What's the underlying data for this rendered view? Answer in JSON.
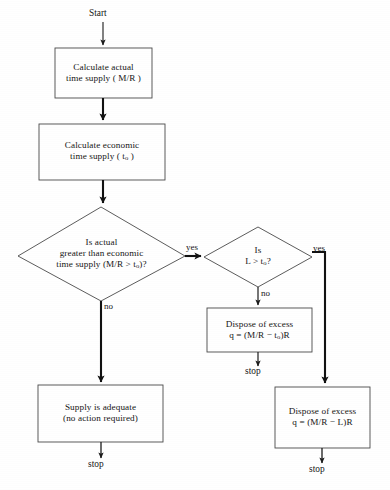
{
  "diagram": {
    "type": "flowchart",
    "background_color": "#ffffff",
    "line_color": "#1b1b1b",
    "text_color": "#161616"
  },
  "terminals": {
    "start": "Start",
    "stop_left": "stop",
    "stop_middle": "stop",
    "stop_right": "stop"
  },
  "process_boxes": [
    {
      "id": "calc-actual",
      "line1": "Calculate actual",
      "line2_prefix": "time supply ( M/R )",
      "line2": "time supply ( M/R )"
    },
    {
      "id": "calc-economic",
      "line1": "Calculate economic",
      "line2_prefix": "time supply ( t",
      "line2_sub": "o",
      "line2_suffix": " )"
    },
    {
      "id": "dispose-excess-t0",
      "line1": "Dispose of excess",
      "line2_prefix": "q = (M/R − t",
      "line2_sub": "o",
      "line2_suffix": ")R"
    },
    {
      "id": "supply-adequate",
      "line1": "Supply is adequate",
      "line2": "(no action required)"
    },
    {
      "id": "dispose-excess-L",
      "line1": "Dispose of excess",
      "line2": "q = (M/R − L)R"
    }
  ],
  "decisions": [
    {
      "id": "decision-actual-vs-economic",
      "line1": "Is actual",
      "line2": "greater than economic",
      "line3_prefix": "time supply  (M/R > t",
      "line3_sub": "o",
      "line3_suffix": ")?"
    },
    {
      "id": "decision-L-vs-t0",
      "line1": "Is",
      "line2_prefix": "L > t",
      "line2_sub": "o",
      "line2_suffix": "?"
    }
  ],
  "edge_labels": {
    "yes_first": "yes",
    "no_first": "no",
    "yes_second": "yes",
    "no_second": "no"
  }
}
